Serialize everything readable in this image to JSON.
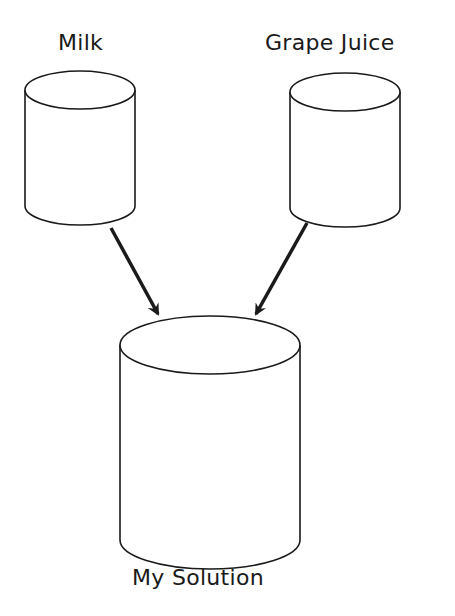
{
  "diagram": {
    "nodes": [
      {
        "id": "milk",
        "label": "Milk"
      },
      {
        "id": "grape_juice",
        "label": "Grape Juice"
      },
      {
        "id": "my_solution",
        "label": "My Solution"
      }
    ],
    "edges": [
      {
        "from": "milk",
        "to": "my_solution"
      },
      {
        "from": "grape_juice",
        "to": "my_solution"
      }
    ],
    "colors": {
      "stroke": "#1a1a1a",
      "fill": "#ffffff"
    }
  }
}
